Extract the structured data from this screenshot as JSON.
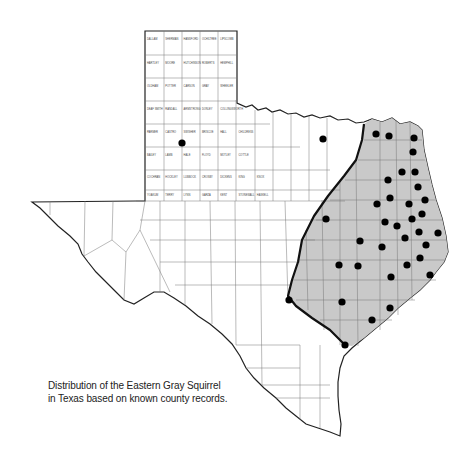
{
  "map": {
    "title": "Distribution of the Eastern Gray Squirrel in Texas",
    "caption_lines": [
      "Distribution of the Eastern Gray Squirrel",
      "in Texas based on known county records."
    ],
    "region": "Texas",
    "subject": "Eastern Gray Squirrel",
    "legend": {
      "shaded_area": "Range of the Eastern Gray Squirrel",
      "dot": "Known county record"
    },
    "colors": {
      "shaded": "#c9c9c9",
      "county_line": "#666666",
      "border": "#222222",
      "range_boundary": "#111111",
      "dot": "#000000"
    },
    "panhandle_labels": [
      [
        "DALLAM",
        "SHERMAN",
        "HANSFORD",
        "OCHILTREE",
        "LIPSCOMB"
      ],
      [
        "HARTLEY",
        "MOORE",
        "HUTCHINSON",
        "ROBERTS",
        "HEMPHILL"
      ],
      [
        "OLDHAM",
        "POTTER",
        "CARSON",
        "GRAY",
        "WHEELER"
      ],
      [
        "DEAF SMITH",
        "RANDALL",
        "ARMSTRONG",
        "DONLEY",
        "COLLINGSWORTH"
      ],
      [
        "PARMER",
        "CASTRO",
        "SWISHER",
        "BRISCOE",
        "HALL",
        "CHILDRESS"
      ],
      [
        "BAILEY",
        "LAMB",
        "HALE",
        "FLOYD",
        "MOTLEY",
        "COTTLE"
      ],
      [
        "COCHRAN",
        "HOCKLEY",
        "LUBBOCK",
        "CROSBY",
        "DICKENS",
        "KING",
        "KNOX"
      ],
      [
        "YOAKUM",
        "TERRY",
        "LYNN",
        "GARZA",
        "KENT",
        "STONEWALL",
        "HASKELL"
      ]
    ],
    "record_dots": [
      {
        "x": 182,
        "y": 143
      },
      {
        "x": 323,
        "y": 139
      },
      {
        "x": 376,
        "y": 134
      },
      {
        "x": 389,
        "y": 136
      },
      {
        "x": 414,
        "y": 138
      },
      {
        "x": 413,
        "y": 152
      },
      {
        "x": 402,
        "y": 172
      },
      {
        "x": 415,
        "y": 172
      },
      {
        "x": 388,
        "y": 180
      },
      {
        "x": 418,
        "y": 187
      },
      {
        "x": 326,
        "y": 219
      },
      {
        "x": 377,
        "y": 204
      },
      {
        "x": 390,
        "y": 198
      },
      {
        "x": 409,
        "y": 204
      },
      {
        "x": 425,
        "y": 200
      },
      {
        "x": 422,
        "y": 214
      },
      {
        "x": 412,
        "y": 219
      },
      {
        "x": 385,
        "y": 222
      },
      {
        "x": 397,
        "y": 226
      },
      {
        "x": 419,
        "y": 232
      },
      {
        "x": 438,
        "y": 233
      },
      {
        "x": 360,
        "y": 241
      },
      {
        "x": 382,
        "y": 247
      },
      {
        "x": 405,
        "y": 238
      },
      {
        "x": 426,
        "y": 245
      },
      {
        "x": 339,
        "y": 265
      },
      {
        "x": 358,
        "y": 266
      },
      {
        "x": 420,
        "y": 258
      },
      {
        "x": 407,
        "y": 265
      },
      {
        "x": 430,
        "y": 275
      },
      {
        "x": 391,
        "y": 277
      },
      {
        "x": 289,
        "y": 300
      },
      {
        "x": 342,
        "y": 302
      },
      {
        "x": 390,
        "y": 308
      },
      {
        "x": 372,
        "y": 320
      },
      {
        "x": 345,
        "y": 345
      }
    ]
  }
}
